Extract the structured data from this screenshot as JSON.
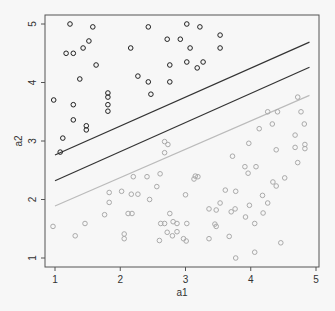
{
  "chart_data": {
    "type": "scatter",
    "title": "",
    "xlabel": "a1",
    "ylabel": "a2",
    "xlim": [
      0.85,
      5.05
    ],
    "ylim": [
      0.95,
      5.15
    ],
    "x_ticks": [
      1,
      2,
      3,
      4,
      5
    ],
    "y_ticks": [
      1,
      2,
      3,
      4,
      5
    ],
    "grid": false,
    "legend": null,
    "colors": {
      "class_a": "#222222",
      "class_b": "#aaaaaa",
      "line_dark": "#333333",
      "line_light": "#bbbbbb",
      "axis": "#555555"
    },
    "series": [
      {
        "name": "class_a",
        "marker": "open-circle",
        "color": "#222222",
        "points": [
          [
            1.23,
            5.0
          ],
          [
            1.58,
            4.95
          ],
          [
            1.52,
            4.71
          ],
          [
            1.43,
            4.59
          ],
          [
            1.17,
            4.5
          ],
          [
            1.28,
            4.5
          ],
          [
            1.63,
            4.3
          ],
          [
            1.38,
            4.06
          ],
          [
            2.16,
            4.59
          ],
          [
            0.98,
            3.7
          ],
          [
            1.28,
            3.62
          ],
          [
            1.28,
            3.36
          ],
          [
            1.48,
            3.26
          ],
          [
            1.48,
            3.19
          ],
          [
            1.12,
            3.05
          ],
          [
            1.08,
            2.81
          ],
          [
            1.81,
            3.82
          ],
          [
            1.81,
            3.75
          ],
          [
            1.81,
            3.62
          ],
          [
            1.81,
            3.51
          ],
          [
            2.43,
            4.95
          ],
          [
            3.02,
            5.0
          ],
          [
            3.22,
            4.95
          ],
          [
            2.72,
            4.74
          ],
          [
            2.92,
            4.74
          ],
          [
            3.07,
            4.59
          ],
          [
            3.53,
            4.81
          ],
          [
            3.53,
            4.59
          ],
          [
            2.76,
            4.3
          ],
          [
            3.02,
            4.35
          ],
          [
            3.18,
            4.25
          ],
          [
            3.27,
            4.35
          ],
          [
            2.27,
            4.11
          ],
          [
            2.43,
            4.01
          ],
          [
            2.76,
            4.01
          ],
          [
            2.47,
            3.8
          ]
        ]
      },
      {
        "name": "class_b",
        "marker": "open-circle",
        "color": "#aaaaaa",
        "points": [
          [
            4.72,
            3.75
          ],
          [
            4.26,
            3.5
          ],
          [
            4.41,
            3.5
          ],
          [
            4.77,
            3.5
          ],
          [
            4.33,
            3.29
          ],
          [
            4.82,
            3.29
          ],
          [
            4.13,
            3.21
          ],
          [
            4.68,
            3.1
          ],
          [
            2.68,
            2.99
          ],
          [
            2.73,
            2.94
          ],
          [
            3.97,
            2.96
          ],
          [
            4.68,
            2.89
          ],
          [
            4.83,
            2.94
          ],
          [
            4.83,
            2.87
          ],
          [
            4.39,
            2.85
          ],
          [
            2.68,
            2.8
          ],
          [
            3.72,
            2.74
          ],
          [
            4.72,
            2.63
          ],
          [
            3.91,
            2.56
          ],
          [
            4.08,
            2.56
          ],
          [
            4.52,
            2.37
          ],
          [
            3.19,
            2.39
          ],
          [
            3.13,
            2.35
          ],
          [
            3.96,
            2.45
          ],
          [
            3.61,
            2.16
          ],
          [
            3.77,
            2.14
          ],
          [
            4.18,
            2.07
          ],
          [
            4.39,
            2.23
          ],
          [
            4.34,
            2.3
          ],
          [
            2.2,
            2.39
          ],
          [
            2.41,
            2.39
          ],
          [
            2.61,
            2.44
          ],
          [
            2.56,
            2.22
          ],
          [
            1.83,
            2.12
          ],
          [
            2.02,
            2.14
          ],
          [
            2.17,
            2.09
          ],
          [
            2.27,
            2.09
          ],
          [
            2.45,
            2.0
          ],
          [
            3.0,
            2.08
          ],
          [
            3.15,
            2.4
          ],
          [
            3.47,
            1.82
          ],
          [
            3.53,
            1.94
          ],
          [
            3.7,
            1.79
          ],
          [
            2.76,
            1.76
          ],
          [
            2.12,
            1.76
          ],
          [
            2.18,
            1.76
          ],
          [
            2.68,
            1.59
          ],
          [
            2.81,
            1.62
          ],
          [
            3.36,
            1.84
          ],
          [
            3.76,
            1.84
          ],
          [
            3.98,
            1.9
          ],
          [
            3.92,
            1.7
          ],
          [
            0.97,
            1.54
          ],
          [
            1.31,
            1.38
          ],
          [
            1.46,
            1.59
          ],
          [
            1.76,
            1.74
          ],
          [
            1.83,
            1.95
          ],
          [
            2.06,
            1.33
          ],
          [
            2.06,
            1.41
          ],
          [
            2.62,
            1.59
          ],
          [
            3.02,
            1.59
          ],
          [
            3.01,
            1.29
          ],
          [
            2.8,
            1.38
          ],
          [
            3.45,
            1.58
          ],
          [
            4.06,
            1.59
          ],
          [
            4.19,
            1.77
          ],
          [
            4.26,
            1.94
          ],
          [
            2.97,
            1.33
          ],
          [
            2.6,
            1.3
          ],
          [
            2.87,
            1.45
          ],
          [
            3.47,
            1.54
          ],
          [
            3.67,
            1.37
          ],
          [
            2.72,
            1.44
          ],
          [
            2.87,
            1.59
          ],
          [
            3.36,
            1.33
          ],
          [
            3.77,
            1.0
          ],
          [
            4.46,
            1.26
          ],
          [
            4.06,
            1.1
          ]
        ]
      }
    ],
    "lines": [
      {
        "name": "upper-margin",
        "color": "#333333",
        "from": [
          1.0,
          2.76
        ],
        "to": [
          4.9,
          4.69
        ]
      },
      {
        "name": "decision-boundary",
        "color": "#333333",
        "from": [
          1.0,
          2.32
        ],
        "to": [
          4.9,
          4.26
        ]
      },
      {
        "name": "lower-margin",
        "color": "#bbbbbb",
        "from": [
          1.0,
          1.89
        ],
        "to": [
          4.9,
          3.78
        ]
      }
    ]
  }
}
